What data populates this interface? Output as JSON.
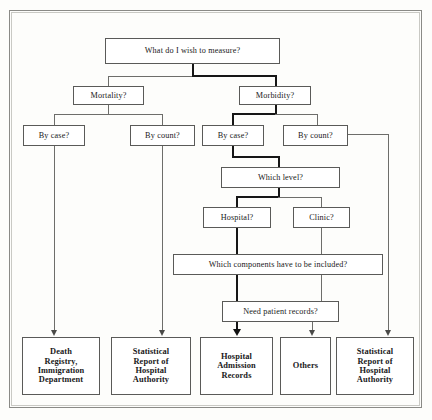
{
  "diagram": {
    "frame": {
      "border_color": "#8a8a86"
    },
    "colors": {
      "box_border": "#5a5a58",
      "line": "#6d6d6a",
      "highlight_path": "#161616",
      "text": "#19191a",
      "background": "#fdfdfb"
    },
    "nodes": [
      {
        "id": "root",
        "label": "What do I wish to measure?",
        "type": "question",
        "level": 0
      },
      {
        "id": "mortality",
        "label": "Mortality?",
        "type": "question",
        "level": 1
      },
      {
        "id": "morbidity",
        "label": "Morbidity?",
        "type": "question",
        "level": 1
      },
      {
        "id": "mort-case",
        "label": "By case?",
        "type": "question",
        "level": 2
      },
      {
        "id": "mort-count",
        "label": "By count?",
        "type": "question",
        "level": 2
      },
      {
        "id": "morb-case",
        "label": "By case?",
        "type": "question",
        "level": 2
      },
      {
        "id": "morb-count",
        "label": "By count?",
        "type": "question",
        "level": 2
      },
      {
        "id": "which-level",
        "label": "Which level?",
        "type": "question",
        "level": 3
      },
      {
        "id": "hospital",
        "label": "Hospital?",
        "type": "question",
        "level": 4
      },
      {
        "id": "clinic",
        "label": "Clinic?",
        "type": "question",
        "level": 4
      },
      {
        "id": "components",
        "label": "Which components have to be included?",
        "type": "question",
        "level": 5
      },
      {
        "id": "records",
        "label": "Need patient records?",
        "type": "question",
        "level": 6
      },
      {
        "id": "t-death",
        "label": "Death Registry, Immigration Department",
        "type": "terminal",
        "level": 7
      },
      {
        "id": "t-stat-1",
        "label": "Statistical Report of Hospital Authority",
        "type": "terminal",
        "level": 7
      },
      {
        "id": "t-har",
        "label": "Hospital Admission Records",
        "type": "terminal",
        "level": 7
      },
      {
        "id": "t-others",
        "label": "Others",
        "type": "terminal",
        "level": 7
      },
      {
        "id": "t-stat-2",
        "label": "Statistical Report of Hospital Authority",
        "type": "terminal",
        "level": 7
      }
    ],
    "edges": [
      {
        "from": "root",
        "to": "mortality",
        "emphasis": "normal"
      },
      {
        "from": "root",
        "to": "morbidity",
        "emphasis": "bold"
      },
      {
        "from": "mortality",
        "to": "mort-case",
        "emphasis": "normal"
      },
      {
        "from": "mortality",
        "to": "mort-count",
        "emphasis": "normal"
      },
      {
        "from": "morbidity",
        "to": "morb-case",
        "emphasis": "bold"
      },
      {
        "from": "morbidity",
        "to": "morb-count",
        "emphasis": "normal"
      },
      {
        "from": "mort-case",
        "to": "t-death",
        "emphasis": "normal",
        "arrow": true
      },
      {
        "from": "mort-count",
        "to": "t-stat-1",
        "emphasis": "normal",
        "arrow": true
      },
      {
        "from": "morb-case",
        "to": "which-level",
        "emphasis": "bold"
      },
      {
        "from": "morb-count",
        "to": "t-stat-2",
        "emphasis": "normal",
        "arrow": true
      },
      {
        "from": "which-level",
        "to": "hospital",
        "emphasis": "bold"
      },
      {
        "from": "which-level",
        "to": "clinic",
        "emphasis": "normal"
      },
      {
        "from": "hospital",
        "to": "components",
        "emphasis": "bold"
      },
      {
        "from": "clinic",
        "to": "components",
        "emphasis": "normal"
      },
      {
        "from": "components",
        "to": "records",
        "emphasis": "bold"
      },
      {
        "from": "records",
        "to": "t-har",
        "emphasis": "bold",
        "arrow": true
      },
      {
        "from": "records",
        "to": "t-others",
        "emphasis": "normal",
        "arrow": true
      }
    ],
    "labels": {
      "root": "What do I wish to measure?",
      "mortality": "Mortality?",
      "morbidity": "Morbidity?",
      "mort_case": "By case?",
      "mort_count": "By count?",
      "morb_case": "By case?",
      "morb_count": "By count?",
      "which_level": "Which level?",
      "hospital": "Hospital?",
      "clinic": "Clinic?",
      "components": "Which components have to be included?",
      "records": "Need patient records?",
      "t_death_l1": "Death",
      "t_death_l2": "Registry,",
      "t_death_l3": "Immigration",
      "t_death_l4": "Department",
      "t_stat1_l1": "Statistical",
      "t_stat1_l2": "Report of",
      "t_stat1_l3": "Hospital",
      "t_stat1_l4": "Authority",
      "t_har_l1": "Hospital",
      "t_har_l2": "Admission",
      "t_har_l3": "Records",
      "t_others": "Others",
      "t_stat2_l1": "Statistical",
      "t_stat2_l2": "Report of",
      "t_stat2_l3": "Hospital",
      "t_stat2_l4": "Authority"
    }
  }
}
